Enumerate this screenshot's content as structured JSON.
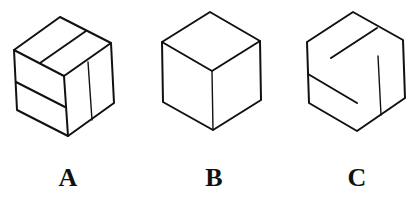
{
  "figure": {
    "options": [
      {
        "id": "A",
        "label": "A",
        "variant": "cube with grooved lines on all three visible faces"
      },
      {
        "id": "B",
        "label": "B",
        "variant": "plain cube"
      },
      {
        "id": "C",
        "label": "C",
        "variant": "hexagon outline with three inner partial lines"
      }
    ],
    "colors": {
      "stroke": "#111111",
      "background": "#ffffff"
    }
  }
}
